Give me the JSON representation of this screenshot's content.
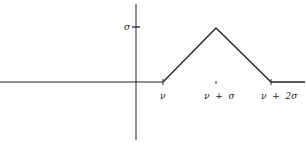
{
  "diagram": {
    "y_tick_label": "σ",
    "x_tick_labels": [
      "ν",
      "ν  +  σ",
      "ν  +  2σ"
    ],
    "points": [
      {
        "label": "ν",
        "x": 163,
        "y": 82
      },
      {
        "label": "peak",
        "x": 216,
        "y": 28
      },
      {
        "label": "ν + 2σ",
        "x": 271,
        "y": 82
      }
    ],
    "line_color": "#222222"
  }
}
